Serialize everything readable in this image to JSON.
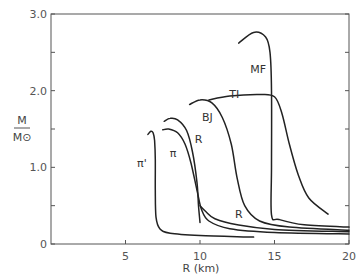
{
  "chart_data": {
    "type": "line",
    "title": "",
    "xlabel": "R (km)",
    "ylabel": "M / M⊙",
    "ylabel_numerator": "M",
    "ylabel_denominator": "M⊙",
    "xlim": [
      0,
      20
    ],
    "ylim": [
      0,
      3.0
    ],
    "grid": false,
    "legend": "none (curves labeled inline)",
    "x_ticks": [
      {
        "value": 5,
        "label": "5"
      },
      {
        "value": 10,
        "label": "10"
      },
      {
        "value": 15,
        "label": "15"
      },
      {
        "value": 20,
        "label": "20"
      }
    ],
    "y_ticks": [
      {
        "value": 0,
        "label": "0"
      },
      {
        "value": 0.5,
        "label": ""
      },
      {
        "value": 1.0,
        "label": "1.0"
      },
      {
        "value": 1.5,
        "label": ""
      },
      {
        "value": 2.0,
        "label": "2.0"
      },
      {
        "value": 2.5,
        "label": ""
      },
      {
        "value": 3.0,
        "label": "3.0"
      }
    ],
    "series": [
      {
        "name": "π'",
        "label_pos": [
          6.1,
          1.0
        ],
        "points": [
          [
            13.6,
            0.09
          ],
          [
            10.0,
            0.11
          ],
          [
            8.0,
            0.14
          ],
          [
            7.3,
            0.2
          ],
          [
            7.05,
            0.35
          ],
          [
            7.0,
            0.7
          ],
          [
            7.0,
            1.1
          ],
          [
            6.95,
            1.35
          ],
          [
            6.85,
            1.45
          ],
          [
            6.7,
            1.47
          ],
          [
            6.5,
            1.43
          ]
        ]
      },
      {
        "name": "π",
        "label_pos": [
          8.2,
          1.14
        ],
        "points": [
          [
            20.0,
            0.13
          ],
          [
            15.0,
            0.15
          ],
          [
            12.0,
            0.2
          ],
          [
            10.6,
            0.3
          ],
          [
            10.1,
            0.45
          ],
          [
            9.8,
            0.7
          ],
          [
            9.4,
            1.05
          ],
          [
            9.0,
            1.3
          ],
          [
            8.5,
            1.45
          ],
          [
            7.9,
            1.5
          ],
          [
            7.5,
            1.49
          ]
        ]
      },
      {
        "name": "R",
        "label_pos": [
          9.9,
          1.32
        ],
        "points": [
          [
            10.0,
            0.28
          ],
          [
            9.9,
            0.5
          ],
          [
            9.8,
            0.8
          ],
          [
            9.5,
            1.2
          ],
          [
            9.1,
            1.48
          ],
          [
            8.5,
            1.62
          ],
          [
            8.0,
            1.64
          ],
          [
            7.6,
            1.6
          ]
        ]
      },
      {
        "name": "R",
        "label_pos": [
          12.6,
          0.34
        ],
        "points": [
          [
            20.0,
            0.16
          ],
          [
            15.0,
            0.19
          ],
          [
            12.5,
            0.25
          ],
          [
            11.0,
            0.33
          ],
          [
            10.4,
            0.42
          ],
          [
            10.0,
            0.5
          ]
        ]
      },
      {
        "name": "BJ",
        "label_pos": [
          10.5,
          1.6
        ],
        "points": [
          [
            20.0,
            0.18
          ],
          [
            16.0,
            0.22
          ],
          [
            14.0,
            0.3
          ],
          [
            13.0,
            0.5
          ],
          [
            12.5,
            0.85
          ],
          [
            12.1,
            1.3
          ],
          [
            11.5,
            1.65
          ],
          [
            10.8,
            1.84
          ],
          [
            10.0,
            1.88
          ],
          [
            9.3,
            1.82
          ]
        ]
      },
      {
        "name": "TI",
        "label_pos": [
          12.3,
          1.9
        ],
        "points": [
          [
            18.6,
            0.39
          ],
          [
            17.3,
            0.6
          ],
          [
            16.6,
            0.9
          ],
          [
            16.0,
            1.3
          ],
          [
            15.5,
            1.7
          ],
          [
            15.0,
            1.92
          ],
          [
            14.0,
            1.95
          ],
          [
            12.0,
            1.93
          ],
          [
            10.6,
            1.88
          ]
        ]
      },
      {
        "name": "MF",
        "label_pos": [
          13.9,
          2.23
        ],
        "points": [
          [
            20.0,
            0.22
          ],
          [
            17.0,
            0.25
          ],
          [
            15.3,
            0.32
          ],
          [
            14.8,
            0.38
          ],
          [
            14.8,
            1.0
          ],
          [
            14.8,
            2.0
          ],
          [
            14.7,
            2.5
          ],
          [
            14.4,
            2.7
          ],
          [
            13.6,
            2.76
          ],
          [
            12.6,
            2.62
          ]
        ]
      }
    ]
  }
}
